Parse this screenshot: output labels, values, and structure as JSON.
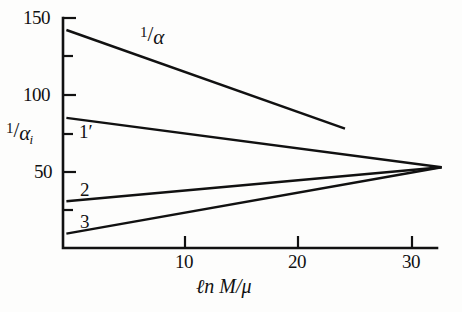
{
  "figure": {
    "background_color": "#fdfdfc",
    "ink_color": "#111111"
  },
  "axes": {
    "y_label": {
      "numerator": "1",
      "slash": "/",
      "denominator": "α",
      "subscript": "i"
    },
    "x_label": {
      "ln": "ℓn",
      "argument": "M/μ",
      "full": "ℓn M/μ"
    },
    "y_tick_labels": [
      "150",
      "100",
      "50"
    ],
    "x_tick_labels": [
      "10",
      "20",
      "30"
    ]
  },
  "series_labels": {
    "alpha": {
      "numerator": "1",
      "slash": "/",
      "denominator": "α"
    },
    "one_prime": "1′",
    "two": "2",
    "three": "3"
  },
  "chart_data": {
    "type": "line",
    "title": "",
    "xlabel": "ℓn M/μ",
    "ylabel": "1/αᵢ",
    "xlim": [
      -0.3,
      35.0
    ],
    "ylim": [
      0,
      158
    ],
    "grid": false,
    "legend": "inline-labels",
    "x_ticks_major": [
      10,
      20,
      30
    ],
    "y_ticks_major": [
      50,
      100,
      150
    ],
    "y_ticks_minor": [
      25,
      75,
      125
    ],
    "series": [
      {
        "name": "1/α",
        "label": "1/α",
        "x": [
          0.0,
          24.5
        ],
        "values": [
          142.0,
          78.0
        ]
      },
      {
        "name": "1′",
        "label": "1′",
        "x": [
          0.0,
          33.0
        ],
        "values": [
          85.0,
          53.0
        ]
      },
      {
        "name": "2",
        "label": "2",
        "x": [
          0.0,
          33.0
        ],
        "values": [
          31.0,
          53.0
        ]
      },
      {
        "name": "3",
        "label": "3",
        "x": [
          0.0,
          33.0
        ],
        "values": [
          10.0,
          53.0
        ]
      }
    ],
    "annotations": [
      {
        "text": "1/α",
        "x": 7.0,
        "y": 135.0
      },
      {
        "text": "1′",
        "x": 0.9,
        "y": 74.0
      },
      {
        "text": "2",
        "x": 0.9,
        "y": 40.0
      },
      {
        "text": "3",
        "x": 0.9,
        "y": 19.0
      }
    ],
    "unification_point": {
      "x": 33.0,
      "y": 53.0
    }
  }
}
